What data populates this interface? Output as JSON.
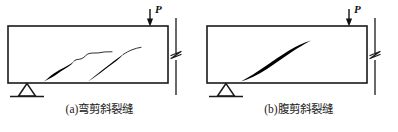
{
  "figure": {
    "background_color": "#ffffff",
    "line_color": "#1a1a1a",
    "crack_color": "#000000",
    "panels": [
      {
        "id": "a",
        "caption": "(a)弯剪斜裂缝",
        "load_label": "P",
        "load_arrow": "down-arrow-icon",
        "support": "triangle-support-icon",
        "break_symbol": "zigzag-break-icon",
        "beam": {
          "x": 8,
          "y": 26,
          "width": 160,
          "height": 57
        },
        "cracks": [
          {
            "name": "flexural-shear-crack-1",
            "from_x": 44,
            "from_y": 81,
            "to_x": 112,
            "to_y": 52
          },
          {
            "name": "flexural-shear-crack-2",
            "from_x": 88,
            "from_y": 81,
            "to_x": 141,
            "to_y": 47
          }
        ]
      },
      {
        "id": "b",
        "caption": "(b)腹剪斜裂缝",
        "load_label": "P",
        "load_arrow": "down-arrow-icon",
        "support": "triangle-support-icon",
        "break_symbol": "zigzag-break-icon",
        "beam": {
          "x": 8,
          "y": 26,
          "width": 160,
          "height": 57
        },
        "cracks": [
          {
            "name": "web-shear-crack-1",
            "from_x": 42,
            "from_y": 81,
            "to_x": 112,
            "to_y": 45
          }
        ]
      }
    ]
  }
}
